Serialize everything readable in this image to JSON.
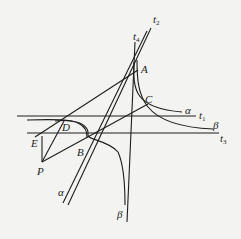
{
  "diagram": {
    "type": "geometric construction",
    "stroke_color": "#1e1e1e",
    "background_color": "#f3f3f1",
    "points": [
      {
        "id": "A",
        "label": "A"
      },
      {
        "id": "B",
        "label": "B"
      },
      {
        "id": "C",
        "label": "C"
      },
      {
        "id": "D",
        "label": "D"
      },
      {
        "id": "E",
        "label": "E"
      },
      {
        "id": "P",
        "label": "P"
      }
    ],
    "lines": [
      {
        "id": "t1",
        "label": "t",
        "sub": "1"
      },
      {
        "id": "t2",
        "label": "t",
        "sub": "2"
      },
      {
        "id": "t3",
        "label": "t",
        "sub": "3"
      },
      {
        "id": "t4",
        "label": "t",
        "sub": "4"
      }
    ],
    "curves": [
      {
        "id": "alpha_upper",
        "label": "α"
      },
      {
        "id": "beta_upper",
        "label": "β"
      },
      {
        "id": "alpha_lower",
        "label": "α"
      },
      {
        "id": "beta_lower",
        "label": "β"
      }
    ]
  }
}
